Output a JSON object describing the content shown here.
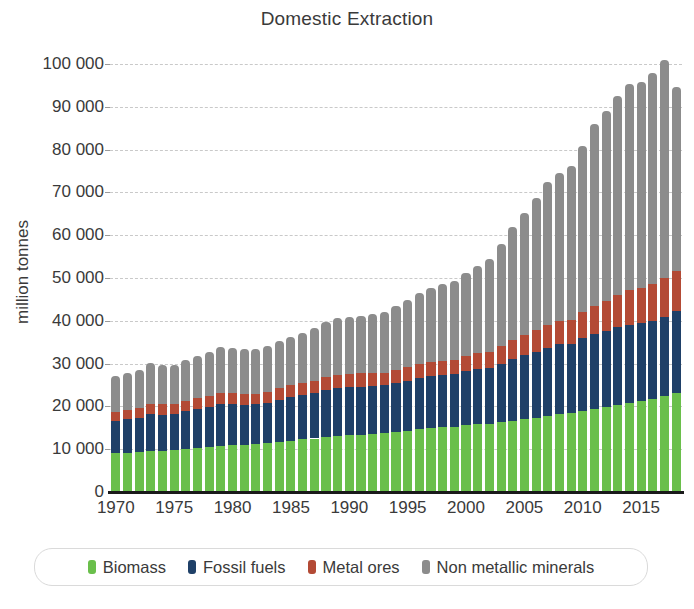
{
  "chart_data": {
    "type": "bar",
    "stacked": true,
    "title": "Domestic Extraction",
    "xlabel": "",
    "ylabel": "million tonnes",
    "ylim": [
      0,
      100000
    ],
    "ytick_values": [
      0,
      10000,
      20000,
      30000,
      40000,
      50000,
      60000,
      70000,
      80000,
      90000,
      100000
    ],
    "ytick_labels": [
      "0",
      "10 000",
      "20 000",
      "30 000",
      "40 000",
      "50 000",
      "60 000",
      "70 000",
      "80 000",
      "90 000",
      "100 000"
    ],
    "xtick_labels": [
      "1970",
      "1975",
      "1980",
      "1985",
      "1990",
      "1995",
      "2000",
      "2005",
      "2010",
      "2015"
    ],
    "xtick_values": [
      1970,
      1975,
      1980,
      1985,
      1990,
      1995,
      2000,
      2005,
      2010,
      2015
    ],
    "grid": "horizontal-dashed",
    "legend_position": "bottom",
    "categories": [
      1970,
      1971,
      1972,
      1973,
      1974,
      1975,
      1976,
      1977,
      1978,
      1979,
      1980,
      1981,
      1982,
      1983,
      1984,
      1985,
      1986,
      1987,
      1988,
      1989,
      1990,
      1991,
      1992,
      1993,
      1994,
      1995,
      1996,
      1997,
      1998,
      1999,
      2000,
      2001,
      2002,
      2003,
      2004,
      2005,
      2006,
      2007,
      2008,
      2009,
      2010,
      2011,
      2012,
      2013,
      2014,
      2015,
      2016,
      2017,
      2018
    ],
    "series": [
      {
        "name": "Biomass",
        "color": "#6ABF4B",
        "values": [
          9000,
          9200,
          9300,
          9600,
          9600,
          9800,
          10000,
          10300,
          10600,
          10800,
          10900,
          11000,
          11200,
          11400,
          11700,
          12000,
          12300,
          12500,
          12900,
          13100,
          13300,
          13400,
          13600,
          13700,
          14000,
          14300,
          14700,
          14900,
          15100,
          15300,
          15600,
          15800,
          16000,
          16300,
          16700,
          17000,
          17400,
          17800,
          18200,
          18500,
          19000,
          19400,
          19900,
          20400,
          20900,
          21300,
          21800,
          22400,
          23200
        ]
      },
      {
        "name": "Fossil fuels",
        "color": "#1F4068",
        "values": [
          7500,
          7800,
          8100,
          8600,
          8500,
          8400,
          8900,
          9100,
          9300,
          9700,
          9600,
          9400,
          9300,
          9400,
          9800,
          10100,
          10300,
          10600,
          10900,
          11100,
          11200,
          11200,
          11200,
          11200,
          11400,
          11600,
          11900,
          12100,
          12200,
          12200,
          12600,
          12900,
          13000,
          13600,
          14300,
          14900,
          15400,
          15900,
          16300,
          16100,
          16900,
          17500,
          17800,
          18100,
          18200,
          18100,
          18200,
          18600,
          19000
        ]
      },
      {
        "name": "Metal ores",
        "color": "#B34A35",
        "values": [
          2100,
          2200,
          2200,
          2400,
          2400,
          2300,
          2400,
          2500,
          2500,
          2700,
          2700,
          2600,
          2500,
          2500,
          2700,
          2800,
          2800,
          2900,
          3000,
          3100,
          3100,
          3100,
          3000,
          3000,
          3100,
          3200,
          3300,
          3400,
          3400,
          3400,
          3600,
          3700,
          3800,
          4100,
          4400,
          4700,
          5000,
          5300,
          5500,
          5500,
          6100,
          6600,
          7000,
          7500,
          8000,
          8200,
          8500,
          8900,
          9500
        ]
      },
      {
        "name": "Non metallic minerals",
        "color": "#8C8C8C",
        "values": [
          8400,
          8600,
          9000,
          9500,
          9200,
          9100,
          9600,
          9900,
          10300,
          10700,
          10500,
          10400,
          10400,
          10700,
          11000,
          11300,
          11800,
          12400,
          13000,
          13400,
          13400,
          13500,
          13800,
          14200,
          15000,
          15700,
          16500,
          17300,
          17800,
          18400,
          19400,
          20300,
          21600,
          24000,
          26500,
          28700,
          31000,
          33400,
          34600,
          36000,
          38800,
          42400,
          44300,
          46600,
          48200,
          48300,
          49500,
          51100,
          43000
        ]
      }
    ]
  },
  "legend": {
    "items": [
      {
        "label": "Biomass",
        "color": "#6ABF4B"
      },
      {
        "label": "Fossil fuels",
        "color": "#1F4068"
      },
      {
        "label": "Metal ores",
        "color": "#B34A35"
      },
      {
        "label": "Non metallic minerals",
        "color": "#8C8C8C"
      }
    ]
  }
}
